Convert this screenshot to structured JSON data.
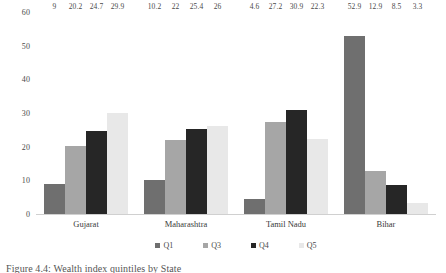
{
  "chart_data": {
    "type": "bar",
    "title": "",
    "xlabel": "",
    "ylabel": "",
    "ylim": [
      0,
      60
    ],
    "yticks": [
      "0",
      "10",
      "20",
      "30",
      "40",
      "50",
      "60"
    ],
    "grid": false,
    "legend_position": "bottom",
    "categories": [
      "Gujarat",
      "Maharashtra",
      "Tamil Nadu",
      "Bihar"
    ],
    "series": [
      {
        "name": "Q1",
        "color": "#6f6f6f",
        "values": [
          9,
          10.2,
          4.6,
          52.9
        ],
        "labels": [
          "9",
          "10.2",
          "4.6",
          "52.9"
        ]
      },
      {
        "name": "Q3",
        "color": "#a6a6a6",
        "values": [
          20.2,
          22,
          27.2,
          12.9
        ],
        "labels": [
          "20.2",
          "22",
          "27.2",
          "12.9"
        ]
      },
      {
        "name": "Q4",
        "color": "#262626",
        "values": [
          24.7,
          25.4,
          30.9,
          8.5
        ],
        "labels": [
          "24.7",
          "25.4",
          "30.9",
          "8.5"
        ]
      },
      {
        "name": "Q5",
        "color": "#e8e8e8",
        "values": [
          29.9,
          26,
          22.3,
          3.3
        ],
        "labels": [
          "29.9",
          "26",
          "22.3",
          "3.3"
        ]
      }
    ]
  },
  "caption": "Figure 4.4: Wealth index quintiles by State"
}
